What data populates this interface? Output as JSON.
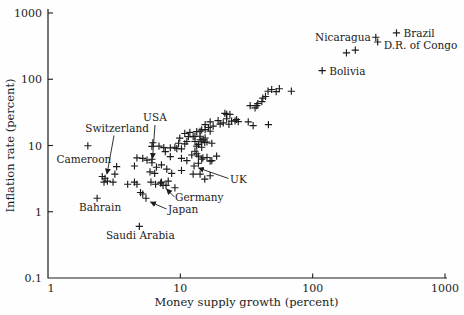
{
  "figure": {
    "background": "#fefefe",
    "ink_color": "#1c1c1c"
  },
  "chart_data": {
    "type": "scatter",
    "title": "",
    "xlabel": "Money supply growth (percent)",
    "ylabel": "Inflation rate (percent)",
    "xscale": "log",
    "yscale": "log",
    "xlim": [
      1,
      1000
    ],
    "ylim": [
      0.1,
      1000
    ],
    "xticks": [
      1,
      10,
      100,
      1000
    ],
    "yticks": [
      0.1,
      1,
      10,
      100,
      1000
    ],
    "grid": false,
    "legend": null,
    "marker": "plus",
    "labeled_points": [
      {
        "name": "Brazil",
        "x": 430,
        "y": 500,
        "dx": 7,
        "dy": 4,
        "anchor": "start"
      },
      {
        "name": "Nicaragua",
        "x": 300,
        "y": 430,
        "dx": -5,
        "dy": 4,
        "anchor": "end"
      },
      {
        "name": "D.R. of Congo",
        "x": 310,
        "y": 365,
        "dx": 6,
        "dy": 7,
        "anchor": "start"
      },
      {
        "name": "Bolivia",
        "x": 118,
        "y": 135,
        "dx": 7,
        "dy": 4,
        "anchor": "start"
      },
      {
        "name": "USA",
        "x": 6.1,
        "y": 5.5,
        "dx": 3,
        "dy": -42,
        "anchor": "middle",
        "leader": [
          155,
          125,
          152.5,
          158.5
        ]
      },
      {
        "name": "UK",
        "x": 12.7,
        "y": 4.9,
        "dx": 36,
        "dy": 17,
        "anchor": "start",
        "leader": [
          228.5,
          178.5,
          198.5,
          168
        ]
      },
      {
        "name": "Switzerland",
        "x": 2.7,
        "y": 3.2,
        "dx": 12,
        "dy": -46,
        "anchor": "middle",
        "leader": [
          114,
          135.5,
          107,
          174
        ]
      },
      {
        "name": "Cameroon",
        "x": 2.0,
        "y": 9.9,
        "dx": -4,
        "dy": 17,
        "anchor": "middle"
      },
      {
        "name": "Bahrain",
        "x": 2.35,
        "y": 1.6,
        "dx": 3,
        "dy": 13,
        "anchor": "middle"
      },
      {
        "name": "Germany",
        "x": 7.4,
        "y": 2.5,
        "dx": 12,
        "dy": 16,
        "anchor": "start",
        "leader": [
          174.5,
          197,
          166.5,
          189
        ]
      },
      {
        "name": "Japan",
        "x": 5.5,
        "y": 1.6,
        "dx": 22,
        "dy": 15,
        "anchor": "start",
        "leader": [
          166.5,
          209,
          150.5,
          202
        ]
      },
      {
        "name": "Saudi Arabia",
        "x": 4.9,
        "y": 0.6,
        "dx": 1,
        "dy": 13,
        "anchor": "middle"
      }
    ],
    "points": [
      [
        180,
        250
      ],
      [
        210,
        275
      ],
      [
        46,
        66
      ],
      [
        49,
        70
      ],
      [
        53,
        65
      ],
      [
        56,
        72
      ],
      [
        69,
        66
      ],
      [
        42,
        52
      ],
      [
        44,
        55
      ],
      [
        38.5,
        43
      ],
      [
        41.3,
        46
      ],
      [
        33.7,
        40
      ],
      [
        36.7,
        37
      ],
      [
        37.8,
        40
      ],
      [
        35.5,
        20
      ],
      [
        46.3,
        20.7
      ],
      [
        32.6,
        22.7
      ],
      [
        19.3,
        23.8
      ],
      [
        20,
        21
      ],
      [
        21.1,
        21.9
      ],
      [
        21.7,
        30.6
      ],
      [
        22.4,
        29.5
      ],
      [
        22.4,
        25.3
      ],
      [
        23.3,
        20.9
      ],
      [
        23.7,
        29.5
      ],
      [
        24.4,
        23.3
      ],
      [
        25.9,
        23.6
      ],
      [
        26.6,
        24.7
      ],
      [
        27.4,
        22.9
      ],
      [
        15.4,
        20.7
      ],
      [
        16.8,
        22.7
      ],
      [
        17.7,
        19.6
      ],
      [
        16.3,
        18.7
      ],
      [
        14.1,
        16.4
      ],
      [
        14.5,
        17.2
      ],
      [
        15.4,
        17.4
      ],
      [
        16.8,
        16.4
      ],
      [
        13.3,
        16.2
      ],
      [
        11.8,
        15.8
      ],
      [
        10.8,
        15.2
      ],
      [
        11.5,
        13.6
      ],
      [
        12.5,
        13.6
      ],
      [
        12.9,
        13.8
      ],
      [
        14.1,
        13.8
      ],
      [
        15.4,
        13
      ],
      [
        9.9,
        12.9
      ],
      [
        14.1,
        12.2
      ],
      [
        14.9,
        12.2
      ],
      [
        11.2,
        11.5
      ],
      [
        12.9,
        11.5
      ],
      [
        14.5,
        11.6
      ],
      [
        15.9,
        11.3
      ],
      [
        15.3,
        11.1
      ],
      [
        17.3,
        10.8
      ],
      [
        10.8,
        10.6
      ],
      [
        9.7,
        10.8
      ],
      [
        13.7,
        10.4
      ],
      [
        13.3,
        9.8
      ],
      [
        14.5,
        9.4
      ],
      [
        12.9,
        8.2
      ],
      [
        6.2,
        11
      ],
      [
        6.1,
        9.7
      ],
      [
        6.9,
        9.8
      ],
      [
        7.5,
        9.3
      ],
      [
        8.4,
        9.2
      ],
      [
        9.1,
        9.4
      ],
      [
        9.4,
        9
      ],
      [
        10.2,
        8.9
      ],
      [
        7.7,
        8.1
      ],
      [
        8.4,
        6.8
      ],
      [
        4.7,
        6.5
      ],
      [
        5.2,
        6.4
      ],
      [
        5.6,
        6
      ],
      [
        6.1,
        6.2
      ],
      [
        10.2,
        6.4
      ],
      [
        11.2,
        5.9
      ],
      [
        12.2,
        7.2
      ],
      [
        13.3,
        7.5
      ],
      [
        13.7,
        6.9
      ],
      [
        14.5,
        6.2
      ],
      [
        14.8,
        6.5
      ],
      [
        15.9,
        6.6
      ],
      [
        16.8,
        5.8
      ],
      [
        17.3,
        5.9
      ],
      [
        18.8,
        6.9
      ],
      [
        13.7,
        5.4
      ],
      [
        3.3,
        4.8
      ],
      [
        4.5,
        4.9
      ],
      [
        6.6,
        4.7
      ],
      [
        7.2,
        5.1
      ],
      [
        7.9,
        4.4
      ],
      [
        5.9,
        4
      ],
      [
        6.4,
        3.8
      ],
      [
        8.6,
        3.8
      ],
      [
        10.2,
        4.2
      ],
      [
        12.5,
        3.7
      ],
      [
        14.1,
        3.7
      ],
      [
        16.8,
        3.5
      ],
      [
        15.3,
        3.1
      ],
      [
        3.2,
        3.7
      ],
      [
        3.1,
        2.8
      ],
      [
        2.57,
        3.4
      ],
      [
        2.81,
        2.9
      ],
      [
        2.65,
        2.8
      ],
      [
        4,
        2.6
      ],
      [
        4.5,
        2.8
      ],
      [
        4.7,
        2.6
      ],
      [
        6,
        2.8
      ],
      [
        6.5,
        2.6
      ],
      [
        7.1,
        2.7
      ],
      [
        7.2,
        2.8
      ],
      [
        7.8,
        2.5
      ],
      [
        8.1,
        2.9
      ],
      [
        9.1,
        2.3
      ],
      [
        5,
        1.95
      ],
      [
        5.2,
        1.85
      ]
    ]
  }
}
